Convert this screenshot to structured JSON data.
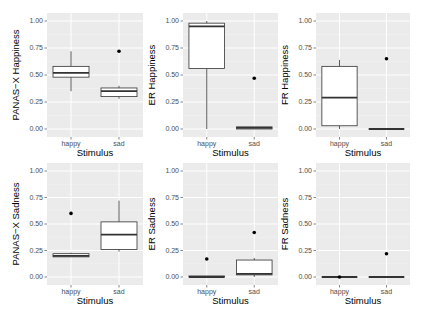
{
  "chart_data": [
    {
      "type": "boxplot",
      "ylabel": "PANAS−X Happiness",
      "xlabel": "Stimulus",
      "categories": [
        "happy",
        "sad"
      ],
      "ylim": [
        0,
        1
      ],
      "yticks": [
        "0.00",
        "0.25",
        "0.50",
        "0.75",
        "1.00"
      ],
      "boxes": [
        {
          "category": "happy",
          "whisker_low": 0.35,
          "q1": 0.48,
          "median": 0.52,
          "q3": 0.58,
          "whisker_high": 0.72,
          "outliers": []
        },
        {
          "category": "sad",
          "whisker_low": 0.28,
          "q1": 0.3,
          "median": 0.35,
          "q3": 0.38,
          "whisker_high": 0.4,
          "outliers": [
            0.72
          ]
        }
      ]
    },
    {
      "type": "boxplot",
      "ylabel": "ER Happiness",
      "xlabel": "Stimulus",
      "categories": [
        "happy",
        "sad"
      ],
      "ylim": [
        0,
        1
      ],
      "yticks": [
        "0.00",
        "0.25",
        "0.50",
        "0.75",
        "1.00"
      ],
      "boxes": [
        {
          "category": "happy",
          "whisker_low": 0.0,
          "q1": 0.56,
          "median": 0.95,
          "q3": 0.98,
          "whisker_high": 1.0,
          "outliers": []
        },
        {
          "category": "sad",
          "whisker_low": 0.0,
          "q1": 0.0,
          "median": 0.01,
          "q3": 0.02,
          "whisker_high": 0.02,
          "outliers": [
            0.47
          ]
        }
      ]
    },
    {
      "type": "boxplot",
      "ylabel": "FR Happiness",
      "xlabel": "Stimulus",
      "categories": [
        "happy",
        "sad"
      ],
      "ylim": [
        0,
        1
      ],
      "yticks": [
        "0.00",
        "0.25",
        "0.50",
        "0.75",
        "1.00"
      ],
      "boxes": [
        {
          "category": "happy",
          "whisker_low": 0.0,
          "q1": 0.03,
          "median": 0.29,
          "q3": 0.58,
          "whisker_high": 0.64,
          "outliers": []
        },
        {
          "category": "sad",
          "whisker_low": 0.0,
          "q1": 0.0,
          "median": 0.0,
          "q3": 0.0,
          "whisker_high": 0.0,
          "outliers": [
            0.65
          ]
        }
      ]
    },
    {
      "type": "boxplot",
      "ylabel": "PANAS−X Sadness",
      "xlabel": "Stimulus",
      "categories": [
        "happy",
        "sad"
      ],
      "ylim": [
        0,
        1
      ],
      "yticks": [
        "0.00",
        "0.25",
        "0.50",
        "0.75",
        "1.00"
      ],
      "boxes": [
        {
          "category": "happy",
          "whisker_low": 0.19,
          "q1": 0.19,
          "median": 0.2,
          "q3": 0.22,
          "whisker_high": 0.23,
          "outliers": [
            0.6
          ]
        },
        {
          "category": "sad",
          "whisker_low": 0.24,
          "q1": 0.26,
          "median": 0.4,
          "q3": 0.52,
          "whisker_high": 0.72,
          "outliers": []
        }
      ]
    },
    {
      "type": "boxplot",
      "ylabel": "ER Sadness",
      "xlabel": "Stimulus",
      "categories": [
        "happy",
        "sad"
      ],
      "ylim": [
        0,
        1
      ],
      "yticks": [
        "0.00",
        "0.25",
        "0.50",
        "0.75",
        "1.00"
      ],
      "boxes": [
        {
          "category": "happy",
          "whisker_low": 0.0,
          "q1": 0.0,
          "median": 0.0,
          "q3": 0.01,
          "whisker_high": 0.01,
          "outliers": [
            0.17
          ]
        },
        {
          "category": "sad",
          "whisker_low": 0.0,
          "q1": 0.02,
          "median": 0.03,
          "q3": 0.16,
          "whisker_high": 0.18,
          "outliers": [
            0.42
          ]
        }
      ]
    },
    {
      "type": "boxplot",
      "ylabel": "FR Sadness",
      "xlabel": "Stimulus",
      "categories": [
        "happy",
        "sad"
      ],
      "ylim": [
        0,
        1
      ],
      "yticks": [
        "0.00",
        "0.25",
        "0.50",
        "0.75",
        "1.00"
      ],
      "boxes": [
        {
          "category": "happy",
          "whisker_low": 0.0,
          "q1": 0.0,
          "median": 0.0,
          "q3": 0.0,
          "whisker_high": 0.0,
          "outliers": [
            0.0
          ]
        },
        {
          "category": "sad",
          "whisker_low": 0.0,
          "q1": 0.0,
          "median": 0.0,
          "q3": 0.0,
          "whisker_high": 0.0,
          "outliers": [
            0.22
          ]
        }
      ]
    }
  ],
  "layout": {
    "panels": [
      {
        "x0": 47,
        "x1": 143,
        "y0": 13,
        "y1": 137,
        "yzero": 129,
        "yone": 21
      },
      {
        "x0": 183,
        "x1": 278,
        "y0": 13,
        "y1": 137,
        "yzero": 129,
        "yone": 21
      },
      {
        "x0": 316,
        "x1": 410,
        "y0": 13,
        "y1": 137,
        "yzero": 129,
        "yone": 21
      },
      {
        "x0": 47,
        "x1": 143,
        "y0": 163,
        "y1": 285,
        "yzero": 277,
        "yone": 171
      },
      {
        "x0": 183,
        "x1": 278,
        "y0": 163,
        "y1": 285,
        "yzero": 277,
        "yone": 171
      },
      {
        "x0": 316,
        "x1": 410,
        "y0": 163,
        "y1": 285,
        "yzero": 277,
        "yone": 171
      }
    ],
    "colors": {
      "panel_bg": "#ebebeb",
      "grid_major": "#ffffff",
      "grid_minor": "#f4f4f4",
      "box_fill": "#ffffff",
      "box_stroke": "#333333",
      "tick_text": "#4d4d4d"
    }
  }
}
